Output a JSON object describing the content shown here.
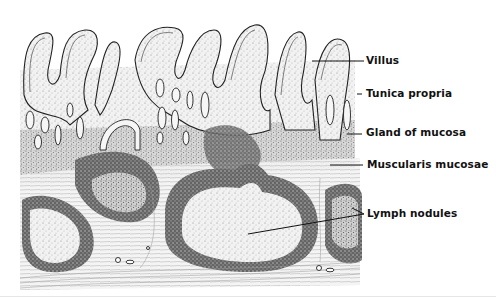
{
  "figure": {
    "labels": [
      {
        "id": "villus",
        "text": "Villus",
        "x": 367,
        "y": 61,
        "line": {
          "x1": 312,
          "y1": 61,
          "x2": 364,
          "y2": 61
        }
      },
      {
        "id": "tunica-propria",
        "text": "Tunica propria",
        "x": 366,
        "y": 94,
        "line": {
          "x1": 357,
          "y1": 94,
          "x2": 362,
          "y2": 94
        }
      },
      {
        "id": "gland-of-mucosa",
        "text": "Gland of mucosa",
        "x": 366,
        "y": 133,
        "line": {
          "x1": 347,
          "y1": 134,
          "x2": 362,
          "y2": 134
        }
      },
      {
        "id": "muscularis-mucosae",
        "text": "Muscularis mucosae",
        "x": 368,
        "y": 166,
        "line": {
          "x1": 330,
          "y1": 165,
          "x2": 363,
          "y2": 165
        }
      },
      {
        "id": "lymph-nodules",
        "text": "Lymph nodules",
        "x": 367,
        "y": 214,
        "line": {
          "x1": 248,
          "y1": 234,
          "x2": 364,
          "y2": 214
        }
      }
    ],
    "colors": {
      "ink": "#111111",
      "stipple": "#444444",
      "light_tissue": "#d8d8d8",
      "background": "#ffffff"
    }
  }
}
